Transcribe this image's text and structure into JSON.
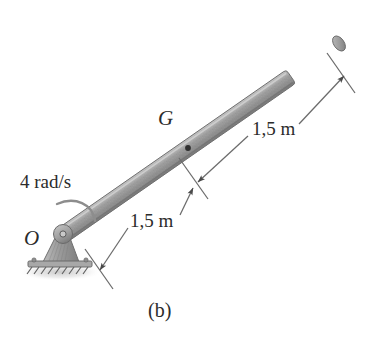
{
  "figure": {
    "caption": "(b)",
    "background_color": "#ffffff",
    "line_color": "#5a5a5a",
    "text_color": "#2b2b2b",
    "rod_color": "#9a9a9a",
    "rod_highlight_color": "#c9c9c9",
    "rod_shadow_color": "#6f6f6f"
  },
  "labels": {
    "angular_velocity": "4 rad/s",
    "pivot_point": "O",
    "center_of_mass": "G",
    "dimension_upper": "1,5 m",
    "dimension_lower": "1,5 m"
  },
  "annotations": {
    "rotation_arrow": "curved-rotation-arrow",
    "pivot_support": "pin-support",
    "ground": "hatched-ground",
    "mass_center_marker": "center-of-mass-dot"
  },
  "geometry": {
    "rod_start": "O (62, 236)",
    "rod_end": "(341, 42)",
    "center_of_mass": "(188, 148)",
    "segment_lengths": [
      "1,5 m",
      "1,5 m"
    ],
    "total_length": "3,0 m"
  }
}
